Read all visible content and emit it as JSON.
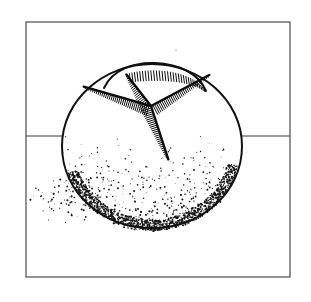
{
  "artwork": {
    "title": "Round scored bread loaf",
    "subject": "boule-bread-loaf",
    "medium": "pen-and-ink line drawing",
    "style": "stipple-and-hatch engraving",
    "caption": "",
    "background_color": "#ffffff",
    "ink_color": "#111111",
    "frame_color": "#3b3b3b"
  },
  "frame": {
    "name": "picture-frame",
    "x": 26,
    "y": 22,
    "width": 264,
    "height": 255,
    "stroke_width": 1.1
  },
  "horizon": {
    "name": "table-horizon-line",
    "y": 136,
    "x_start": 26,
    "x_end": 290,
    "stroke_width": 1.2
  },
  "loaf": {
    "name": "bread-loaf",
    "center_x": 152,
    "center_y": 148,
    "radius_x": 90,
    "radius_y": 84,
    "outline_stroke": 2.0,
    "top_lobe": {
      "name": "loaf-top-lobe",
      "description": "raised dome segment at the crown of the loaf"
    },
    "scores": [
      {
        "name": "score-upper-right",
        "angle_deg": -28,
        "length": 66
      },
      {
        "name": "score-left",
        "angle_deg": 196,
        "length": 70
      },
      {
        "name": "score-lower-right",
        "angle_deg": 72,
        "length": 56
      },
      {
        "name": "score-upper-left",
        "angle_deg": 232,
        "length": 40
      }
    ],
    "score_center": {
      "x": 151,
      "y": 106
    }
  },
  "shading": {
    "name": "stipple-shadow",
    "type": "stipple",
    "dot_count": 1450,
    "dot_radius_min": 0.38,
    "dot_radius_max": 1.05,
    "density_top_y": 120,
    "density_bottom_y": 232,
    "ground_shadow": {
      "name": "cast-shadow",
      "direction": "left",
      "extent_x": 48
    }
  },
  "artifacts": [
    {
      "name": "scan-speck",
      "x": 176,
      "y": 50,
      "r": 1.6
    }
  ]
}
